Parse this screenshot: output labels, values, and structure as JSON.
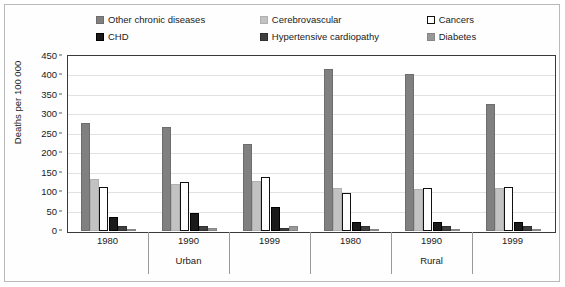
{
  "chart_data": {
    "type": "bar",
    "title": "",
    "subtitle": "",
    "xlabel": "",
    "ylabel": "Deaths per 100 000",
    "ylim": [
      0,
      450
    ],
    "yticks": [
      0,
      50,
      100,
      150,
      200,
      250,
      300,
      350,
      400,
      450
    ],
    "grid": true,
    "legend_position": "top",
    "grouping": "grouped-bars",
    "categories": [
      "1980",
      "1990",
      "1999",
      "1980",
      "1990",
      "1999"
    ],
    "group_labels": [
      "Urban",
      "Rural"
    ],
    "group_spans": [
      3,
      3
    ],
    "series": [
      {
        "name": "Other chronic diseases",
        "color": "#808080",
        "border": "#6d6d6d",
        "values": [
          277,
          268,
          225,
          417,
          404,
          327
        ]
      },
      {
        "name": "Cerebrovascular",
        "color": "#c2c2c2",
        "border": "#b0b0b0",
        "values": [
          133,
          122,
          128,
          110,
          108,
          110
        ]
      },
      {
        "name": "Cancers",
        "color": "#ffffff",
        "border": "#111111",
        "values": [
          113,
          127,
          139,
          98,
          111,
          112
        ]
      },
      {
        "name": "CHD",
        "color": "#1a1a1a",
        "border": "#000000",
        "values": [
          36,
          46,
          63,
          22,
          24,
          23
        ]
      },
      {
        "name": "Hypertensive cardiopathy",
        "color": "#3f3f3f",
        "border": "#303030",
        "values": [
          13,
          12,
          9,
          12,
          12,
          13
        ]
      },
      {
        "name": "Diabetes",
        "color": "#989898",
        "border": "#868686",
        "values": [
          4,
          8,
          14,
          3,
          3,
          4
        ]
      }
    ]
  },
  "legend": {
    "items": [
      {
        "label": "Other chronic diseases",
        "swatch": "#808080",
        "swatch_border": "#6d6d6d"
      },
      {
        "label": "Cerebrovascular",
        "swatch": "#c2c2c2",
        "swatch_border": "#b0b0b0"
      },
      {
        "label": "Cancers",
        "swatch": "#ffffff",
        "swatch_border": "#111111"
      },
      {
        "label": "CHD",
        "swatch": "#1a1a1a",
        "swatch_border": "#000000"
      },
      {
        "label": "Hypertensive cardiopathy",
        "swatch": "#3f3f3f",
        "swatch_border": "#303030"
      },
      {
        "label": "Diabetes",
        "swatch": "#989898",
        "swatch_border": "#868686"
      }
    ]
  },
  "axes": {
    "y_title": "Deaths per 100 000",
    "y_ticks": [
      "450",
      "400",
      "350",
      "300",
      "250",
      "200",
      "150",
      "100",
      "50",
      "0"
    ],
    "x_years": [
      "1980",
      "1990",
      "1999",
      "1980",
      "1990",
      "1999"
    ],
    "x_regions": [
      "Urban",
      "Rural"
    ]
  }
}
